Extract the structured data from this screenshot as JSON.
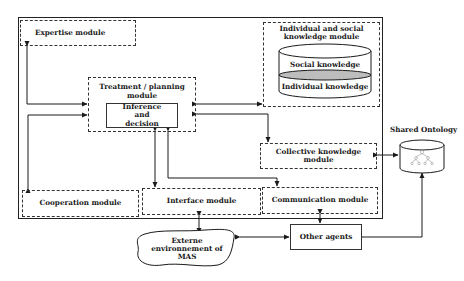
{
  "diagram": {
    "type": "agent-architecture",
    "agent_boundary": {
      "style": "solid"
    },
    "modules": {
      "expertise": {
        "label": "Expertise module"
      },
      "treatment": {
        "label": "Treatment / planning module",
        "inner": {
          "label": "Inference and decision"
        }
      },
      "knowledge": {
        "label_line1": "Individual and social",
        "label_line2": "knowledge module",
        "layers": {
          "top": "Social knowledge",
          "bottom": "Individual knowledge"
        }
      },
      "collective": {
        "label_line1": "Collective knowledge",
        "label_line2": "module"
      },
      "cooperation": {
        "label": "Cooperation module"
      },
      "interface": {
        "label": "Interface module"
      },
      "communication": {
        "label": "Communication module"
      }
    },
    "external": {
      "shared_ontology": {
        "label": "Shared Ontology",
        "icon": "database-tree-icon"
      },
      "other_agents": {
        "label": "Other agents"
      },
      "environment": {
        "line1": "Externe",
        "line2": "environnement of",
        "line3": "MAS"
      }
    },
    "connections": [
      {
        "from": "Expertise module",
        "to": "Treatment / planning module",
        "type": "bidirectional"
      },
      {
        "from": "Cooperation module",
        "to": "Treatment / planning module",
        "type": "bidirectional"
      },
      {
        "from": "Treatment / planning module",
        "to": "Individual and social knowledge module",
        "type": "bidirectional"
      },
      {
        "from": "Treatment / planning module",
        "to": "Collective knowledge module",
        "type": "bidirectional"
      },
      {
        "from": "Inference and decision",
        "to": "Interface module",
        "type": "bidirectional"
      },
      {
        "from": "Inference and decision",
        "to": "Communication module",
        "type": "bidirectional"
      },
      {
        "from": "Collective knowledge module",
        "to": "Shared Ontology",
        "type": "bidirectional"
      },
      {
        "from": "Interface module",
        "to": "Externe environnement of MAS",
        "type": "bidirectional"
      },
      {
        "from": "Communication module",
        "to": "Other agents",
        "type": "bidirectional"
      },
      {
        "from": "Externe environnement of MAS",
        "to": "Other agents",
        "type": "bidirectional"
      },
      {
        "from": "Other agents",
        "to": "Shared Ontology",
        "type": "bidirectional"
      }
    ]
  }
}
